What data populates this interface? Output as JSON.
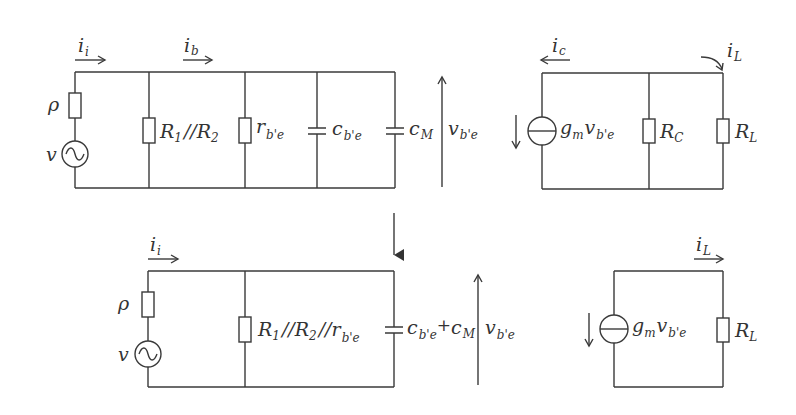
{
  "colors": {
    "wire": "#3a3a3a",
    "text": "#333333",
    "background": "#ffffff"
  },
  "top_left_circuit": {
    "current_in": {
      "main": "i",
      "sub": "i"
    },
    "current_base": {
      "main": "i",
      "sub": "b"
    },
    "source_resistor": {
      "main": "ρ"
    },
    "source": {
      "main": "v"
    },
    "r_bias": {
      "main": "R",
      "sub1": "1",
      "sep": "//",
      "main2": "R",
      "sub2": "2"
    },
    "r_be": {
      "main": "r",
      "sub": "b'e"
    },
    "c_be": {
      "main": "c",
      "sub": "b'e"
    },
    "c_m": {
      "main": "c",
      "sub": "M"
    },
    "voltage": {
      "main": "v",
      "sub": "b'e"
    }
  },
  "top_right_circuit": {
    "current_c": {
      "main": "i",
      "sub": "c"
    },
    "current_l": {
      "main": "i",
      "sub": "L"
    },
    "gm_source": {
      "main": "g",
      "sub": "m",
      "main2": "v",
      "sub2": "b'e"
    },
    "r_c": {
      "main": "R",
      "sub": "C"
    },
    "r_l": {
      "main": "R",
      "sub": "L"
    }
  },
  "bottom_left_circuit": {
    "current_in": {
      "main": "i",
      "sub": "i"
    },
    "source_resistor": {
      "main": "ρ"
    },
    "source": {
      "main": "v"
    },
    "r_combined": {
      "main": "R",
      "sub1": "1",
      "sep1": "//",
      "main2": "R",
      "sub2": "2",
      "sep2": "//",
      "main3": "r",
      "sub3": "b'e"
    },
    "c_combined": {
      "main": "c",
      "sub": "b'e",
      "plus": "+",
      "main2": "c",
      "sub2": "M"
    },
    "voltage": {
      "main": "v",
      "sub": "b'e"
    }
  },
  "bottom_right_circuit": {
    "current_l": {
      "main": "i",
      "sub": "L"
    },
    "gm_source": {
      "main": "g",
      "sub": "m",
      "main2": "v",
      "sub2": "b'e"
    },
    "r_l": {
      "main": "R",
      "sub": "L"
    }
  }
}
